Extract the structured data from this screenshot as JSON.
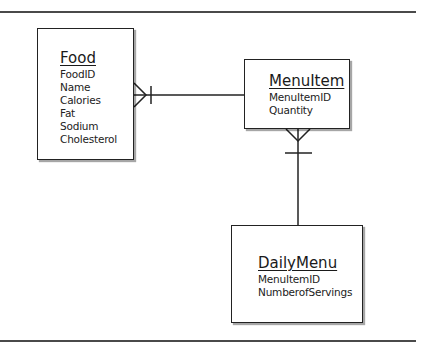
{
  "diagram": {
    "type": "entity-relationship",
    "entities": [
      {
        "name": "Food",
        "attributes": [
          "FoodID",
          "Name",
          "Calories",
          "Fat",
          "Sodium",
          "Cholesterol"
        ]
      },
      {
        "name": "MenuItem",
        "attributes": [
          "MenuItemID",
          "Quantity"
        ]
      },
      {
        "name": "DailyMenu",
        "attributes": [
          "MenuItemID",
          "NumberofServings"
        ]
      }
    ],
    "relationships": [
      {
        "from": "Food",
        "to": "MenuItem",
        "from_cardinality": "many",
        "to_cardinality": "one"
      },
      {
        "from": "MenuItem",
        "to": "DailyMenu",
        "from_cardinality": "many",
        "to_cardinality": "one"
      }
    ],
    "colors": {
      "line": "#222222",
      "rule": "#4a4a4a",
      "background": "#ffffff"
    }
  }
}
